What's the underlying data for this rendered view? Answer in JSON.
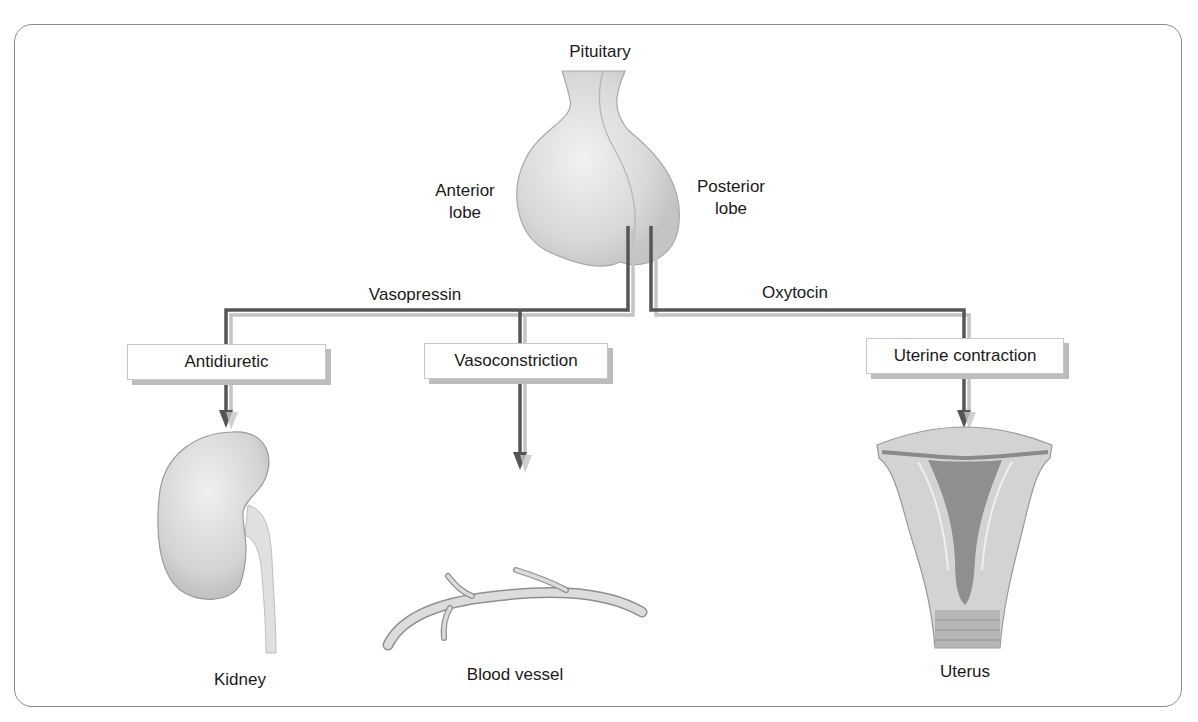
{
  "diagram": {
    "title_label": "Pituitary",
    "lobes": {
      "anterior": {
        "line1": "Anterior",
        "line2": "lobe"
      },
      "posterior": {
        "line1": "Posterior",
        "line2": "lobe"
      }
    },
    "hormones": [
      {
        "id": "vasopressin",
        "label": "Vasopressin"
      },
      {
        "id": "oxytocin",
        "label": "Oxytocin"
      }
    ],
    "effects": [
      {
        "id": "antidiuretic",
        "label": "Antidiuretic",
        "hormone": "vasopressin",
        "target": "Kidney"
      },
      {
        "id": "vasoconstriction",
        "label": "Vasoconstriction",
        "hormone": "vasopressin",
        "target": "Blood vessel"
      },
      {
        "id": "uterine-contraction",
        "label": "Uterine contraction",
        "hormone": "oxytocin",
        "target": "Uterus"
      }
    ],
    "targets": [
      {
        "id": "kidney",
        "label": "Kidney"
      },
      {
        "id": "blood-vessel",
        "label": "Blood vessel"
      },
      {
        "id": "uterus",
        "label": "Uterus"
      }
    ],
    "colors": {
      "arrow_dark": "#555555",
      "arrow_shadow": "#c4c4c4",
      "organ_fill": "#d9d9d9",
      "organ_stroke": "#9a9a9a",
      "uterus_cavity": "#8f8f8f"
    }
  }
}
